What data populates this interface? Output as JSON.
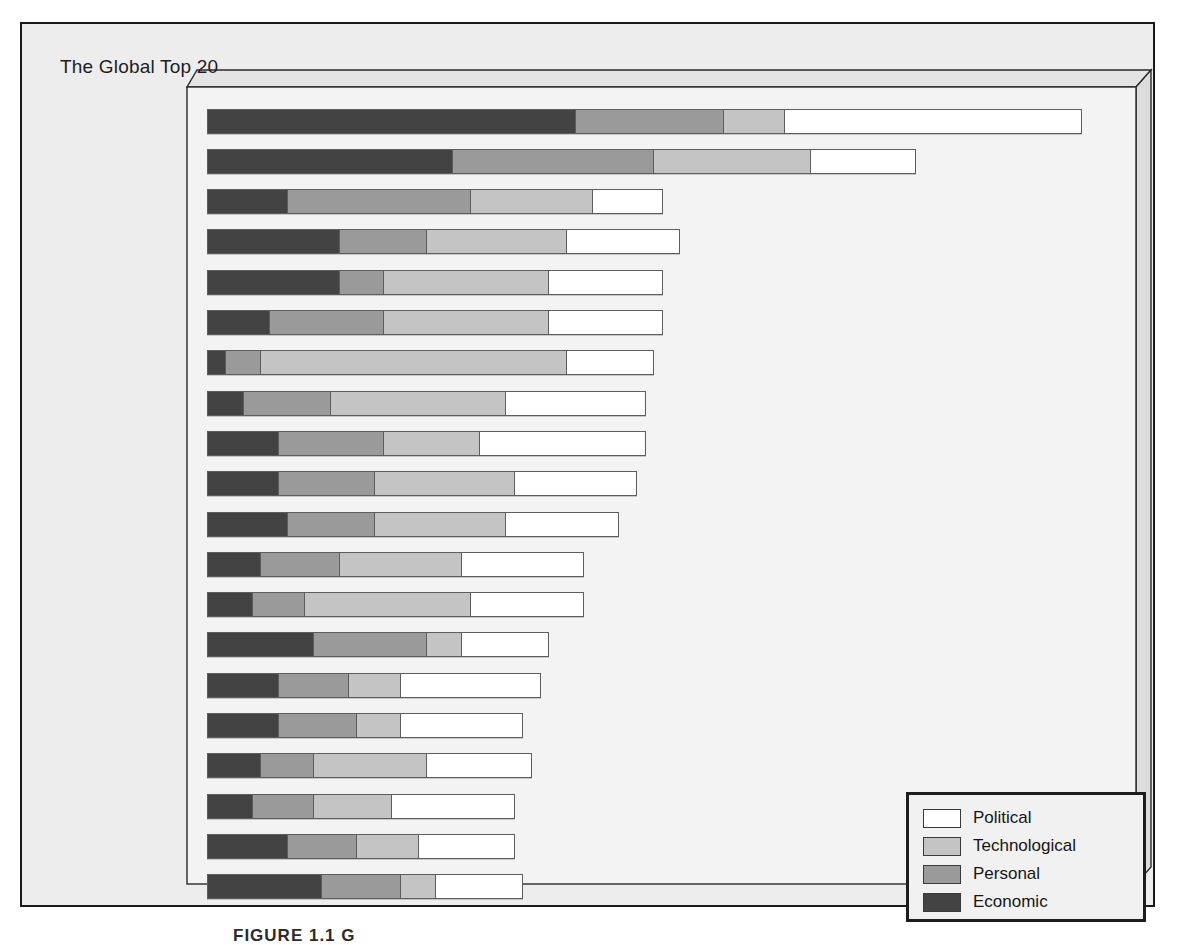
{
  "panel": {
    "title": "The Global Top 20"
  },
  "caption": "FIGURE 1.1  G",
  "colors": {
    "economic": "#434343",
    "personal": "#9a9a9a",
    "technological": "#c4c4c4",
    "political": "#ffffff",
    "page_background": "#ededed",
    "plot_face": "#f3f3f3",
    "border": "#1a1a1a"
  },
  "legend": {
    "position": "bottom-right",
    "items": [
      {
        "label": "Political",
        "color": "#ffffff"
      },
      {
        "label": "Technological",
        "color": "#c4c4c4"
      },
      {
        "label": "Personal",
        "color": "#9a9a9a"
      },
      {
        "label": "Economic",
        "color": "#434343"
      }
    ]
  },
  "chart_data": {
    "type": "bar",
    "orientation": "horizontal",
    "stacked": true,
    "title": "The Global Top 20",
    "xlabel": "",
    "ylabel": "",
    "grid": false,
    "legend_position": "bottom-right",
    "xlim": [
      0,
      100
    ],
    "series_order": [
      "Economic",
      "Personal",
      "Technological",
      "Political"
    ],
    "categories": [
      "Ireland",
      "Singapore",
      "Switzerland",
      "Netherlands",
      "Finland",
      "Canada",
      "United States",
      "New Zealand",
      "Austria",
      "Denmark",
      "Sweden",
      "United Kingdom",
      "Australia",
      "Czech Republic",
      "France",
      "Portugal",
      "Norway",
      "Germany",
      "Slovenia",
      "Malaysia"
    ],
    "series": [
      {
        "name": "Economic",
        "color": "#434343",
        "values": [
          42,
          28,
          9,
          15,
          15,
          7,
          2,
          4,
          8,
          8,
          9,
          6,
          5,
          12,
          8,
          8,
          6,
          5,
          9,
          13
        ]
      },
      {
        "name": "Personal",
        "color": "#9a9a9a",
        "values": [
          17,
          23,
          21,
          10,
          5,
          13,
          4,
          10,
          12,
          11,
          10,
          9,
          6,
          13,
          8,
          9,
          6,
          7,
          8,
          9
        ]
      },
      {
        "name": "Technological",
        "color": "#c4c4c4",
        "values": [
          7,
          18,
          14,
          16,
          19,
          19,
          35,
          20,
          11,
          16,
          15,
          14,
          19,
          4,
          6,
          5,
          13,
          9,
          7,
          4
        ]
      },
      {
        "name": "Political",
        "color": "#ffffff",
        "values": [
          34,
          12,
          8,
          13,
          13,
          13,
          10,
          16,
          19,
          14,
          13,
          14,
          13,
          10,
          16,
          14,
          12,
          14,
          11,
          10
        ]
      }
    ],
    "totals": [
      100,
      81,
      52,
      54,
      52,
      52,
      51,
      50,
      50,
      49,
      47,
      43,
      43,
      39,
      38,
      36,
      37,
      35,
      35,
      36
    ]
  },
  "rows": [
    {
      "label": "Ireland",
      "segments": [
        42,
        17,
        7,
        34
      ]
    },
    {
      "label": "Singapore",
      "segments": [
        28,
        23,
        18,
        12
      ]
    },
    {
      "label": "Switzerland",
      "segments": [
        9,
        21,
        14,
        8
      ]
    },
    {
      "label": "Netherlands",
      "segments": [
        15,
        10,
        16,
        13
      ]
    },
    {
      "label": "Finland",
      "segments": [
        15,
        5,
        19,
        13
      ]
    },
    {
      "label": "Canada",
      "segments": [
        7,
        13,
        19,
        13
      ]
    },
    {
      "label": "United States",
      "segments": [
        2,
        4,
        35,
        10
      ]
    },
    {
      "label": "New Zealand",
      "segments": [
        4,
        10,
        20,
        16
      ]
    },
    {
      "label": "Austria",
      "segments": [
        8,
        12,
        11,
        19
      ]
    },
    {
      "label": "Denmark",
      "segments": [
        8,
        11,
        16,
        14
      ]
    },
    {
      "label": "Sweden",
      "segments": [
        9,
        10,
        15,
        13
      ]
    },
    {
      "label": "United Kingdom",
      "segments": [
        6,
        9,
        14,
        14
      ]
    },
    {
      "label": "Australia",
      "segments": [
        5,
        6,
        19,
        13
      ]
    },
    {
      "label": "Czech Republic",
      "segments": [
        12,
        13,
        4,
        10
      ]
    },
    {
      "label": "France",
      "segments": [
        8,
        8,
        6,
        16
      ]
    },
    {
      "label": "Portugal",
      "segments": [
        8,
        9,
        5,
        14
      ]
    },
    {
      "label": "Norway",
      "segments": [
        6,
        6,
        13,
        12
      ]
    },
    {
      "label": "Germany",
      "segments": [
        5,
        7,
        9,
        14
      ]
    },
    {
      "label": "Slovenia",
      "segments": [
        9,
        8,
        7,
        11
      ]
    },
    {
      "label": "Malaysia",
      "segments": [
        13,
        9,
        4,
        10
      ]
    }
  ]
}
